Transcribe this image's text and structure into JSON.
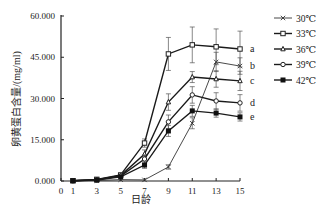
{
  "chart_data": {
    "type": "line",
    "title": "",
    "xlabel": "日龄",
    "ylabel": "卵黄蛋白含量/(mg/ml)",
    "xlim": [
      0,
      15
    ],
    "ylim": [
      0,
      60
    ],
    "x_ticks": [
      "0",
      "1",
      "3",
      "5",
      "7",
      "9",
      "11",
      "13",
      "15"
    ],
    "y_ticks": [
      "0.000",
      "15.000",
      "30.000",
      "45.000",
      "60.000"
    ],
    "grid": false,
    "legend_position": "right",
    "x": [
      1,
      3,
      5,
      7,
      9,
      11,
      13,
      15
    ],
    "series": [
      {
        "name": "30℃",
        "marker": "x",
        "values": [
          0.1,
          0.2,
          0.5,
          0.4,
          5.1,
          21.0,
          43.3,
          41.8
        ],
        "errors": [
          0.2,
          0.2,
          0.3,
          0.3,
          0.8,
          2.0,
          3.5,
          3.0
        ],
        "line_width": 0.8
      },
      {
        "name": "33℃",
        "marker": "square-open",
        "values": [
          0.1,
          0.6,
          2.2,
          13.8,
          46.2,
          49.5,
          48.8,
          48.0
        ],
        "errors": [
          0.2,
          0.3,
          0.5,
          1.5,
          6.0,
          6.5,
          6.5,
          6.5
        ],
        "line_width": 1.4
      },
      {
        "name": "36℃",
        "marker": "triangle",
        "values": [
          0.1,
          0.5,
          2.0,
          9.8,
          28.7,
          37.8,
          37.1,
          36.4
        ],
        "errors": [
          0.2,
          0.3,
          0.5,
          1.5,
          3.0,
          2.0,
          3.0,
          3.5
        ],
        "line_width": 1.4
      },
      {
        "name": "39℃",
        "marker": "circle",
        "values": [
          0.1,
          0.4,
          1.8,
          8.0,
          21.5,
          31.3,
          29.1,
          28.4
        ],
        "errors": [
          0.2,
          0.3,
          0.5,
          1.5,
          2.5,
          3.0,
          3.0,
          3.0
        ],
        "line_width": 1.4
      },
      {
        "name": "42℃",
        "marker": "square-filled",
        "values": [
          0.1,
          0.3,
          1.5,
          5.8,
          18.2,
          25.5,
          24.7,
          23.3
        ],
        "errors": [
          0.2,
          0.3,
          0.5,
          1.2,
          2.0,
          2.0,
          1.5,
          1.5
        ],
        "line_width": 1.4
      }
    ],
    "annotations": [
      {
        "text": "a",
        "series": "33℃"
      },
      {
        "text": "b",
        "series": "30℃"
      },
      {
        "text": "c",
        "series": "36℃"
      },
      {
        "text": "d",
        "series": "39℃"
      },
      {
        "text": "e",
        "series": "42℃"
      }
    ]
  }
}
